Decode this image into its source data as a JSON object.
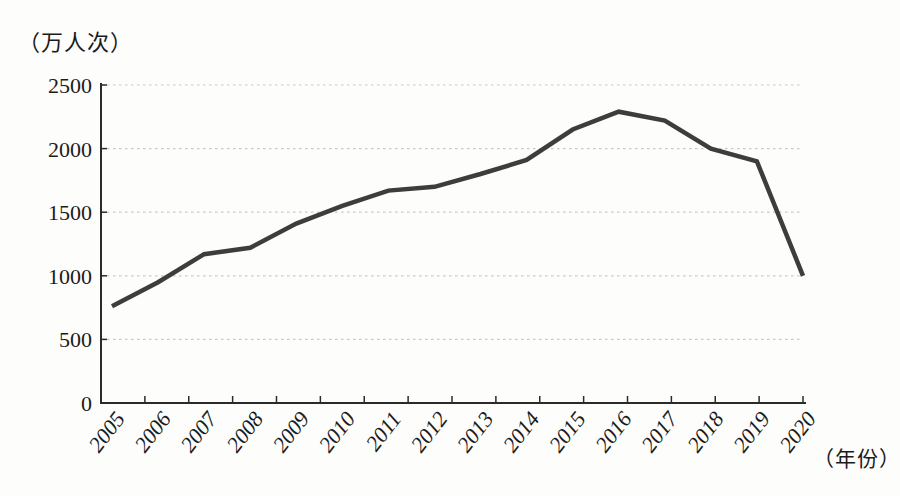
{
  "chart_data": {
    "type": "line",
    "title": "",
    "unit_label_y": "（万人次）",
    "unit_label_x": "（年份）",
    "categories": [
      "2005",
      "2006",
      "2007",
      "2008",
      "2009",
      "2010",
      "2011",
      "2012",
      "2013",
      "2014",
      "2015",
      "2016",
      "2017",
      "2018",
      "2019",
      "2020"
    ],
    "series": [
      {
        "name": "visitors",
        "values": [
          760,
          950,
          1170,
          1220,
          1410,
          1550,
          1670,
          1700,
          1800,
          1910,
          2150,
          2290,
          2220,
          2000,
          1900,
          1000
        ]
      }
    ],
    "ylim": [
      0,
      2500
    ],
    "yticks": [
      0,
      500,
      1000,
      1500,
      2000,
      2500
    ],
    "grid": "horizontal-dotted",
    "legend": "none",
    "colors": {
      "line": "#3d3d3d",
      "axis": "#2b2b2b",
      "grid": "#c9c9c3",
      "text": "#1b1b1b",
      "background": "#fdfdfb"
    }
  }
}
